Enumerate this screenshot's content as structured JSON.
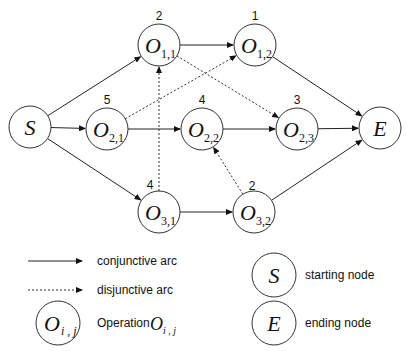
{
  "nodes": {
    "S": {
      "label": "S"
    },
    "E": {
      "label": "E"
    },
    "O11": {
      "label": "O",
      "sub": "1,1",
      "weight": "2"
    },
    "O12": {
      "label": "O",
      "sub": "1,2",
      "weight": "1"
    },
    "O21": {
      "label": "O",
      "sub": "2,1",
      "weight": "5"
    },
    "O22": {
      "label": "O",
      "sub": "2,2",
      "weight": "4"
    },
    "O23": {
      "label": "O",
      "sub": "2,3",
      "weight": "3"
    },
    "O31": {
      "label": "O",
      "sub": "3,1",
      "weight": "4"
    },
    "O32": {
      "label": "O",
      "sub": "3,2",
      "weight": "2"
    }
  },
  "conjunctive_arcs": [
    [
      "S",
      "O11"
    ],
    [
      "S",
      "O21"
    ],
    [
      "S",
      "O31"
    ],
    [
      "O11",
      "O12"
    ],
    [
      "O21",
      "O22"
    ],
    [
      "O22",
      "O23"
    ],
    [
      "O31",
      "O32"
    ],
    [
      "O12",
      "E"
    ],
    [
      "O23",
      "E"
    ],
    [
      "O32",
      "E"
    ]
  ],
  "disjunctive_arcs": [
    [
      "O21",
      "O12"
    ],
    [
      "O11",
      "O23"
    ],
    [
      "O31",
      "O11"
    ],
    [
      "O32",
      "O22"
    ]
  ],
  "legend": {
    "conjunctive": "conjunctive arc",
    "disjunctive": "disjunctive arc",
    "operation": "Operation",
    "operation_symbol": "O",
    "operation_sub": "i , j",
    "start_symbol": "S",
    "start": "starting node",
    "end_symbol": "E",
    "end": "ending node"
  }
}
